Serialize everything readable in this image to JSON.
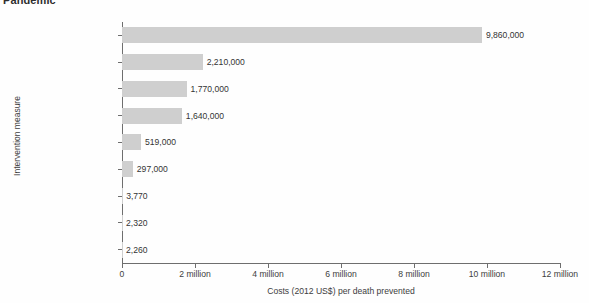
{
  "chart_data": {
    "type": "bar",
    "orientation": "horizontal",
    "title": "Pandemic",
    "xlabel": "Costs (2012 US$) per death prevented",
    "ylabel": "Intervention measure",
    "xlim": [
      0,
      12000000
    ],
    "grid": false,
    "legend": null,
    "bar_color": "#cfcfcf",
    "categories": [
      "School closure",
      "Quarantine",
      "Antiviral therapy",
      "Social distancing",
      "Antiviral stockpile",
      "Vaccination",
      "Surveillance",
      "Face masks",
      "Contact tracing"
    ],
    "values": [
      9860000,
      2210000,
      1770000,
      1640000,
      519000,
      297000,
      3770,
      2320,
      2260
    ],
    "value_labels": [
      "9,860,000",
      "2,210,000",
      "1,770,000",
      "1,640,000",
      "519,000",
      "297,000",
      "3,770",
      "2,320",
      "2,260"
    ],
    "xticks": [
      0,
      2000000,
      4000000,
      6000000,
      8000000,
      10000000,
      12000000
    ],
    "xtick_labels": [
      "0",
      "2 million",
      "4 million",
      "6 million",
      "8 million",
      "10 million",
      "12 million"
    ]
  }
}
